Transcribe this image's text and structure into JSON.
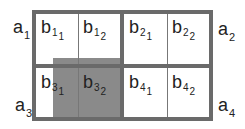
{
  "diagram": {
    "outer_labels": [
      {
        "id": "a1",
        "base": "a",
        "sub": "1"
      },
      {
        "id": "a2",
        "base": "a",
        "sub": "2"
      },
      {
        "id": "a3",
        "base": "a",
        "sub": "3"
      },
      {
        "id": "a4",
        "base": "a",
        "sub": "4"
      }
    ],
    "cells": [
      {
        "id": "b11",
        "base": "b",
        "sub": "1",
        "subsub": "1"
      },
      {
        "id": "b12",
        "base": "b",
        "sub": "1",
        "subsub": "2"
      },
      {
        "id": "b21",
        "base": "b",
        "sub": "2",
        "subsub": "1"
      },
      {
        "id": "b22",
        "base": "b",
        "sub": "2",
        "subsub": "2"
      },
      {
        "id": "b31",
        "base": "b",
        "sub": "3",
        "subsub": "1"
      },
      {
        "id": "b32",
        "base": "b",
        "sub": "3",
        "subsub": "2"
      },
      {
        "id": "b41",
        "base": "b",
        "sub": "4",
        "subsub": "1"
      },
      {
        "id": "b42",
        "base": "b",
        "sub": "4",
        "subsub": "2"
      }
    ],
    "colors": {
      "border": "#6a6a6a",
      "highlight": "#8a8a8a",
      "background": "#ffffff"
    }
  }
}
